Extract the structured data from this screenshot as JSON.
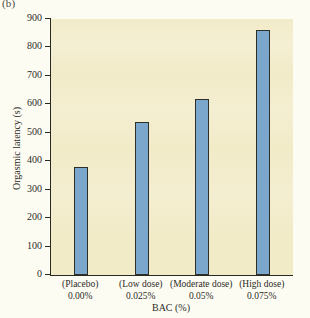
{
  "panel": {
    "label": "(b)"
  },
  "chart_data": {
    "type": "bar",
    "title": "",
    "subtitle": "",
    "xlabel": "BAC (%)",
    "ylabel": "Orgasmic latency (s)",
    "categories": [
      "(Placebo)",
      "(Low dose)",
      "(Moderate dose)",
      "(High dose)"
    ],
    "category_sublabels": [
      "0.00%",
      "0.025%",
      "0.05%",
      "0.075%"
    ],
    "values": [
      380,
      538,
      620,
      860
    ],
    "ylim": [
      0,
      900
    ],
    "yticks": [
      0,
      100,
      200,
      300,
      400,
      500,
      600,
      700,
      800,
      900
    ],
    "ytick_labels": [
      "0",
      "100",
      "200",
      "300",
      "400",
      "500",
      "600",
      "700",
      "800",
      "900"
    ],
    "grid": false,
    "legend": null,
    "bar_color": "#7ba7cc",
    "bar_edge_color": "#2f2f2a",
    "plot_background": "#f2ebc8",
    "figure_background": "#fdfcf3"
  }
}
